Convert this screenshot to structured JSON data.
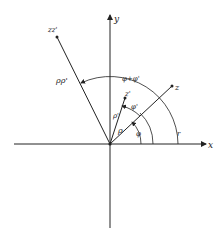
{
  "diagram": {
    "axes": {
      "x_label": "x",
      "y_label": "y"
    },
    "vectors": {
      "z_label": "z",
      "z_prime_label": "z'",
      "zz_prime_label": "zz'"
    },
    "angle_labels": {
      "phi": "φ",
      "phi_prime": "φ'",
      "phi_sum": "φ+φ'",
      "r": "r",
      "rho": "ρ",
      "rho_prime": "ρ'",
      "rho_rho_prime": "ρρ'"
    },
    "colors": {
      "ink": "#222222",
      "background": "#ffffff"
    }
  }
}
